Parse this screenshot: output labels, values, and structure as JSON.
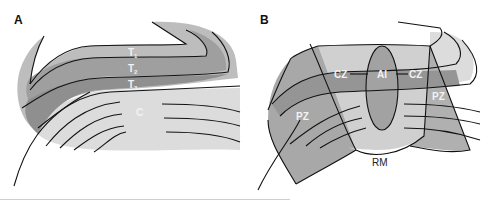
{
  "panels": [
    {
      "id": "A",
      "label": "A",
      "layers": [
        {
          "label": "T1",
          "base": "T",
          "sub": "1"
        },
        {
          "label": "T2",
          "base": "T",
          "sub": "2"
        },
        {
          "label": "T3",
          "base": "T",
          "sub": "3"
        }
      ],
      "core_label": "C"
    },
    {
      "id": "B",
      "label": "B",
      "zones": {
        "left_cz": "CZ",
        "ai": "AI",
        "right_cz": "CZ",
        "left_pz": "PZ",
        "right_pz": "PZ",
        "rm": "RM"
      }
    }
  ],
  "colors": {
    "light_gray": "#c8c8c8",
    "mid_gray": "#a9a9a9",
    "dark_gray": "#8e8e8e",
    "pale_gray": "#dcdcdc",
    "outline": "#111111"
  }
}
